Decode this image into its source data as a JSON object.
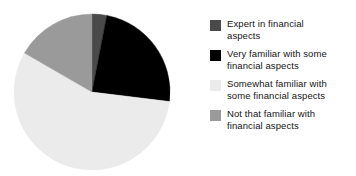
{
  "chart_data": {
    "type": "pie",
    "title": "",
    "subtitle": "",
    "xlabel": "",
    "ylabel": "",
    "grid": false,
    "legend_position": "right",
    "start_angle_deg": 0,
    "direction": "clockwise",
    "categories": [
      "Expert in financial aspects",
      "Very familiar with some financial aspects",
      "Somewhat familiar with some financial aspects",
      "Not that familiar with financial aspects"
    ],
    "values": [
      3,
      24,
      56,
      17
    ],
    "unit": "percent",
    "colors": [
      "#4a4a4a",
      "#000000",
      "#ebebeb",
      "#9a9a9a"
    ],
    "slices": [
      {
        "label": "Expert in financial aspects",
        "value": 3,
        "color": "#4a4a4a",
        "start_angle_deg": 0,
        "end_angle_deg": 11
      },
      {
        "label": "Very familiar with some financial aspects",
        "value": 24,
        "color": "#000000",
        "start_angle_deg": 11,
        "end_angle_deg": 97
      },
      {
        "label": "Somewhat familiar with some financial aspects",
        "value": 56,
        "color": "#ebebeb",
        "start_angle_deg": 97,
        "end_angle_deg": 300
      },
      {
        "label": "Not that familiar with financial aspects",
        "value": 17,
        "color": "#9a9a9a",
        "start_angle_deg": 300,
        "end_angle_deg": 360
      }
    ]
  },
  "legend": {
    "items": [
      {
        "label": "Expert in financial\naspects",
        "color": "#4a4a4a",
        "swatch_name": "legend-swatch-expert"
      },
      {
        "label": "Very familiar with some\nfinancial aspects",
        "color": "#000000",
        "swatch_name": "legend-swatch-very-familiar"
      },
      {
        "label": "Somewhat familiar with\nsome financial aspects",
        "color": "#ebebeb",
        "swatch_name": "legend-swatch-somewhat-familiar"
      },
      {
        "label": "Not that familiar with\nfinancial aspects",
        "color": "#9a9a9a",
        "swatch_name": "legend-swatch-not-familiar"
      }
    ]
  }
}
